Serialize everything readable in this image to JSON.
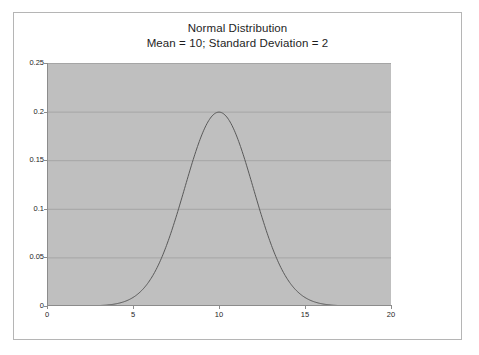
{
  "chart_data": {
    "type": "line",
    "title": "Normal Distribution",
    "subtitle": "Mean = 10; Standard Deviation = 2",
    "title_lines": [
      "Normal Distribution",
      "Mean = 10; Standard Deviation = 2"
    ],
    "xlabel": "",
    "ylabel": "",
    "xlim": [
      0,
      20
    ],
    "ylim": [
      0,
      0.25
    ],
    "xticks": [
      0,
      5,
      10,
      15,
      20
    ],
    "xtick_labels": [
      "0",
      "5",
      "10",
      "15",
      "20"
    ],
    "yticks": [
      0,
      0.05,
      0.1,
      0.15,
      0.2,
      0.25
    ],
    "ytick_labels": [
      "0",
      "0.05",
      "0.1",
      "0.15",
      "0.2",
      "0.25"
    ],
    "grid": "horizontal",
    "legend": "none",
    "plot_background": "#bfbfbf",
    "gridline_color": "#a5a5a5",
    "line_color": "#595959",
    "distribution": {
      "mean": 10,
      "standard_deviation": 2,
      "peak_value": 0.1995
    },
    "series": [
      {
        "name": "Normal PDF",
        "x": [
          0,
          1,
          2,
          3,
          4,
          5,
          6,
          7,
          8,
          9,
          10,
          11,
          12,
          13,
          14,
          15,
          16,
          17,
          18,
          19,
          20
        ],
        "values": [
          0.0,
          0.0,
          0.0001,
          0.0009,
          0.0044,
          0.0175,
          0.054,
          0.121,
          0.176,
          0.176,
          0.1995,
          0.176,
          0.121,
          0.054,
          0.0175,
          0.0044,
          0.0009,
          0.0001,
          0.0,
          0.0,
          0.0
        ]
      }
    ]
  }
}
